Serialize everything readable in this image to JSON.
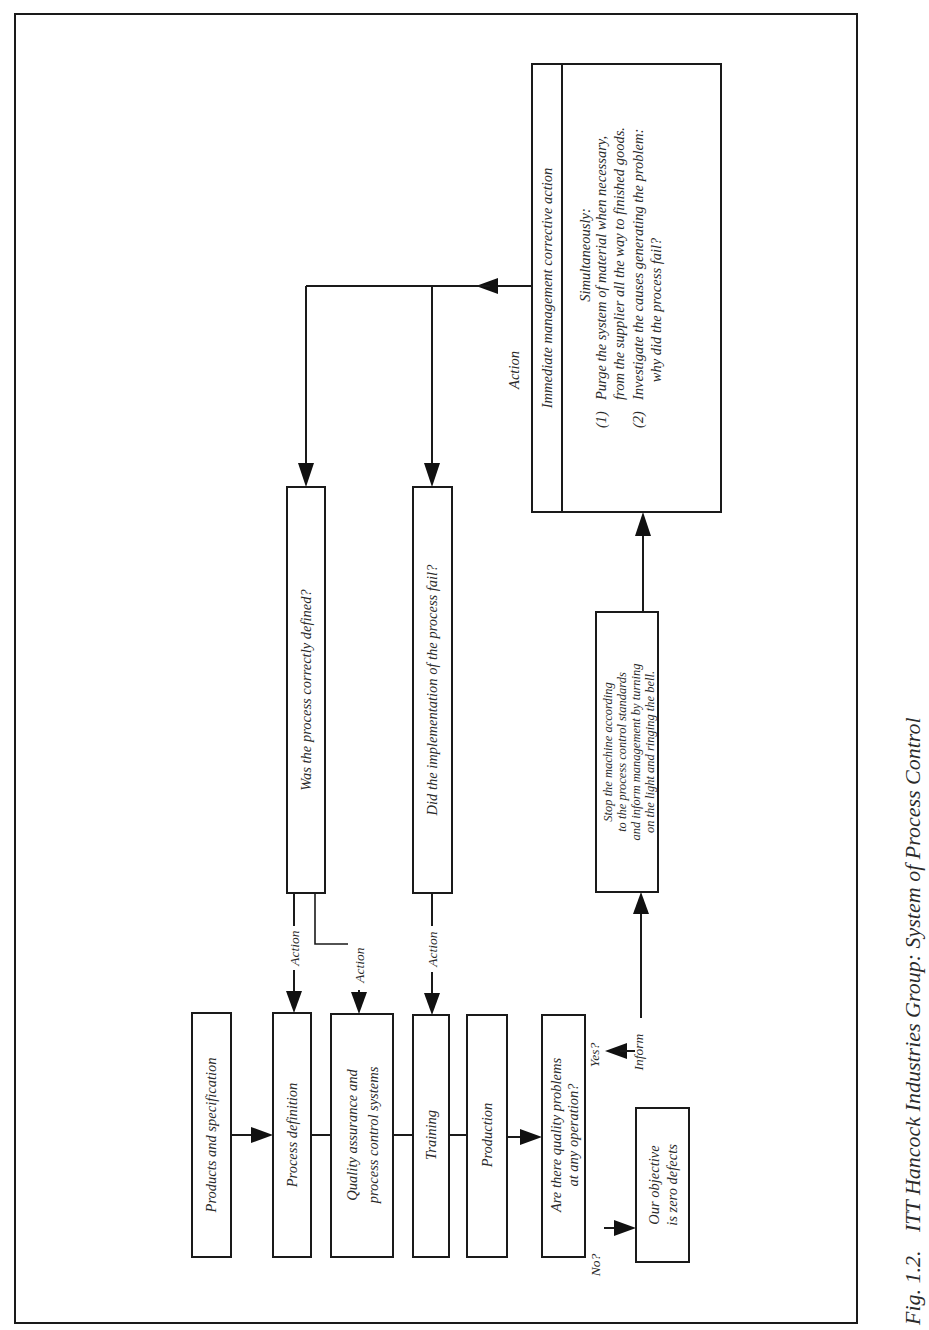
{
  "diagram": {
    "orientation": "rotated 90° counter-clockwise (text reads bottom-to-top)",
    "nodes": {
      "products": {
        "label": "Products and specification"
      },
      "process_definition": {
        "label": "Process definition"
      },
      "quality_assurance": {
        "line1": "Quality assurance  and",
        "line2": "process control systems"
      },
      "training": {
        "label": "Training"
      },
      "production": {
        "label": "Production"
      },
      "quality_problems": {
        "line1": "Are there quality problems",
        "line2": "at any operation?"
      },
      "zero_defects": {
        "line1": "Our objective",
        "line2": "is zero defects"
      },
      "process_defined_question": {
        "label": "Was the process correctly defined?"
      },
      "implementation_question": {
        "label": "Did the implementation of the process fail?"
      },
      "stop_machine": {
        "line1": "Stop the machine according",
        "line2": "to the process control standards",
        "line3": "and inform management by turning",
        "line4": "on the light and ringing the bell."
      },
      "management_action": {
        "header": "Immediate management corrective action",
        "intro": "Simultaneously:",
        "item1_num": "(1)",
        "item1_line1": "Purge the system of material when necessary,",
        "item1_line2": "from the supplier all the way to finished goods.",
        "item2_num": "(2)",
        "item2_line1": "Investigate the causes generating the problem:",
        "item2_line2": "why did the process fail?"
      }
    },
    "edge_labels": {
      "action_1": "Action",
      "action_2": "Action",
      "action_3": "Action",
      "action_top": "Action",
      "yes": "Yes?",
      "no": "No?",
      "inform": "Inform"
    }
  },
  "caption": {
    "figure_number": "Fig. 1.2.",
    "title": "ITT Hancock Industries Group: System of Process Control"
  }
}
